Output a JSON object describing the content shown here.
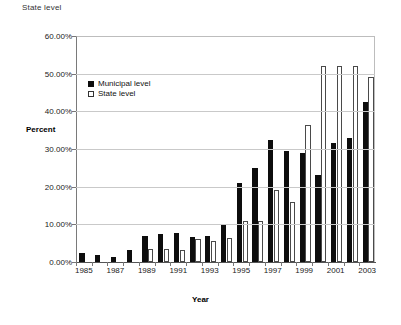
{
  "corner_label": "State level",
  "legend": {
    "position": "inside-top-left",
    "items": [
      {
        "label": "Municipal level",
        "marker": "filled-square",
        "color": "#0d0d0d"
      },
      {
        "label": "State level",
        "marker": "open-square",
        "color": "#ffffff"
      }
    ]
  },
  "chart_data": {
    "type": "bar",
    "title": "",
    "subtitle": "",
    "xlabel": "Year",
    "ylabel": "Percent",
    "ylim": [
      0,
      60
    ],
    "yticks": [
      0,
      10,
      20,
      30,
      40,
      50,
      60
    ],
    "ytick_labels": [
      "0.00%",
      "10.00%",
      "20.00%",
      "30.00%",
      "40.00%",
      "50.00%",
      "60.00%"
    ],
    "grid": "horizontal",
    "categories": [
      1985,
      1986,
      1987,
      1988,
      1989,
      1990,
      1991,
      1992,
      1993,
      1994,
      1995,
      1996,
      1997,
      1998,
      1999,
      2000,
      2001,
      2002,
      2003
    ],
    "xtick_labels": [
      "1985",
      "1987",
      "1989",
      "1991",
      "1993",
      "1995",
      "1997",
      "1999",
      "2001",
      "2003"
    ],
    "series": [
      {
        "name": "Municipal level",
        "color": "#0d0d0d",
        "values": [
          2.5,
          1.8,
          1.3,
          3.2,
          7.0,
          7.5,
          7.7,
          6.7,
          7.0,
          9.9,
          21.0,
          25.0,
          32.3,
          29.5,
          29.0,
          23.0,
          31.5,
          33.0,
          42.5
        ]
      },
      {
        "name": "State level",
        "color": "#ffffff",
        "values": [
          0,
          0,
          0,
          0,
          3.5,
          3.5,
          3.3,
          6.2,
          5.7,
          6.3,
          11.0,
          11.0,
          19.0,
          16.0,
          36.5,
          52.0,
          52.0,
          52.0,
          49.0
        ]
      }
    ]
  }
}
